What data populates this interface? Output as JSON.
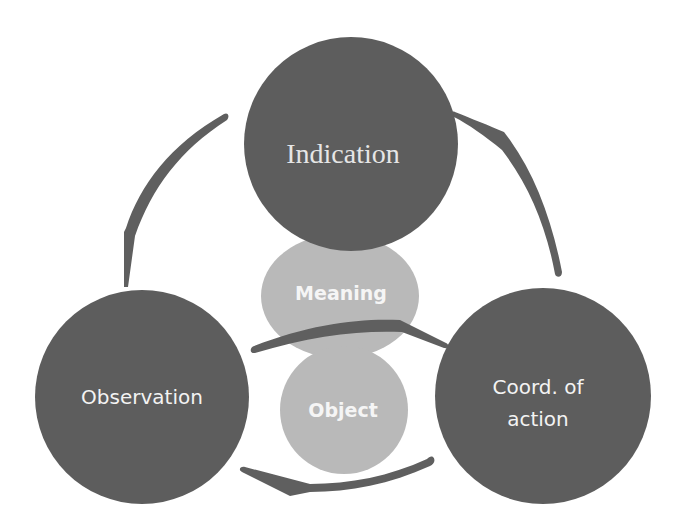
{
  "diagram": {
    "type": "cycle",
    "nodes": {
      "indication": {
        "label": "Indication",
        "color": "#5d5d5d"
      },
      "observation": {
        "label": "Observation",
        "color": "#5d5d5d"
      },
      "coord_action": {
        "label_line1": "Coord. of",
        "label_line2": "action",
        "color": "#5d5d5d"
      },
      "meaning": {
        "label": "Meaning",
        "color": "#b9b9b9"
      },
      "object": {
        "label": "Object",
        "color": "#b9b9b9"
      }
    },
    "arrows": [
      {
        "from": "Indication",
        "to": "Coord. of action"
      },
      {
        "from": "Coord. of action",
        "to": "Observation",
        "path": "bottom"
      },
      {
        "from": "Observation",
        "to": "Indication"
      },
      {
        "from": "Coord. of action",
        "to": "Observation",
        "path": "middle"
      }
    ],
    "background": "#ffffff"
  }
}
